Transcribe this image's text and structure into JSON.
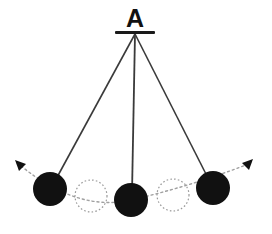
{
  "figure": {
    "type": "physics-diagram",
    "background_color": "#ffffff",
    "width": 272,
    "height": 234
  },
  "labels": {
    "pivot": "A"
  },
  "colors": {
    "ink": "#111111",
    "bob_fill": "#111111",
    "string": "#3a3a3a",
    "ghost_outline": "#9a9a9a",
    "arc_path": "#a0a0a0",
    "background": "#ffffff"
  },
  "geometry": {
    "pivot": {
      "x": 135,
      "y": 34
    },
    "support_bar": {
      "x1": 115,
      "y1": 32.5,
      "x2": 155,
      "y2": 32.5,
      "thickness": 3
    },
    "label_position": {
      "x": 135,
      "y": 27
    },
    "strings": [
      {
        "name": "string-left",
        "x1": 135,
        "y1": 34,
        "x2": 55,
        "y2": 181
      },
      {
        "name": "string-center",
        "x1": 135,
        "y1": 34,
        "x2": 132,
        "y2": 193
      },
      {
        "name": "string-right",
        "x1": 135,
        "y1": 34,
        "x2": 209,
        "y2": 180
      }
    ],
    "bobs": [
      {
        "name": "bob-left-extreme",
        "cx": 50,
        "cy": 189,
        "r": 17,
        "style": "solid"
      },
      {
        "name": "bob-center-equilibrium",
        "cx": 131,
        "cy": 200,
        "r": 17,
        "style": "solid"
      },
      {
        "name": "bob-right-extreme",
        "cx": 213,
        "cy": 188,
        "r": 17,
        "style": "solid"
      }
    ],
    "ghost_bobs": [
      {
        "name": "ghost-bob-left",
        "cx": 91,
        "cy": 196,
        "r": 16,
        "style": "dotted"
      },
      {
        "name": "ghost-bob-right",
        "cx": 173,
        "cy": 195,
        "r": 16,
        "style": "dotted"
      }
    ],
    "arc_path": {
      "name": "swing-arc",
      "d": "M 21 166 Q 78 212 131 200 Q 188 187 246 165",
      "dash": "2 3"
    },
    "arrowheads": [
      {
        "name": "arrowhead-left",
        "x": 17,
        "y": 163,
        "angle": -140
      },
      {
        "name": "arrowhead-right",
        "x": 250,
        "y": 162,
        "angle": -40
      }
    ]
  }
}
